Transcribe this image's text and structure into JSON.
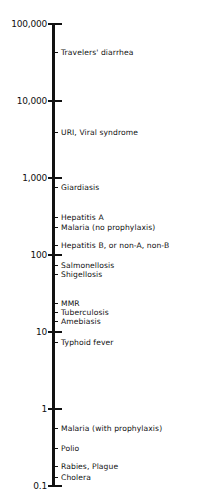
{
  "chart_data": {
    "type": "scatter",
    "title": "",
    "xlabel": "",
    "ylabel": "",
    "scale": "log",
    "orientation": "vertical",
    "ylim": [
      0.1,
      100000
    ],
    "grid": false,
    "legend": null,
    "ticks": [
      {
        "label": "100,000",
        "value": 100000
      },
      {
        "label": "10,000",
        "value": 10000
      },
      {
        "label": "1,000",
        "value": 1000
      },
      {
        "label": "100",
        "value": 100
      },
      {
        "label": "10",
        "value": 10
      },
      {
        "label": "1",
        "value": 1
      },
      {
        "label": "0.1",
        "value": 0.1
      }
    ],
    "items": [
      {
        "label": "Travelers' diarrhea",
        "value": 43000
      },
      {
        "label": "URI, Viral syndrome",
        "value": 4000
      },
      {
        "label": "Giardiasis",
        "value": 760
      },
      {
        "label": "Hepatitis A",
        "value": 310
      },
      {
        "label": "Malaria (no prophylaxis)",
        "value": 230
      },
      {
        "label": "Hepatitis B, or non-A, non-B",
        "value": 135
      },
      {
        "label": "Salmonellosis",
        "value": 74
      },
      {
        "label": "Shigellosis",
        "value": 56
      },
      {
        "label": "MMR",
        "value": 24
      },
      {
        "label": "Tuberculosis",
        "value": 18
      },
      {
        "label": "Amebiasis",
        "value": 14
      },
      {
        "label": "Typhoid fever",
        "value": 7.4
      },
      {
        "label": "Malaria (with prophylaxis)",
        "value": 0.56
      },
      {
        "label": "Polio",
        "value": 0.31
      },
      {
        "label": "Rabies, Plague",
        "value": 0.18
      },
      {
        "label": "Cholera",
        "value": 0.13
      }
    ]
  },
  "layout": {
    "axis_top_px": 24,
    "axis_bottom_px": 486,
    "px_per_decade": 77
  }
}
